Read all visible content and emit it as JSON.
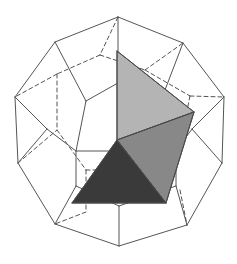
{
  "figure": {
    "type": "geometric-line-drawing",
    "canvas": {
      "width": 237,
      "height": 264,
      "background": "#ffffff"
    },
    "colors": {
      "stroke": "#555555",
      "solid_edge": "#555555",
      "hidden_edge": "#555555",
      "face_light": "#b4b4b4",
      "face_medium": "#888888",
      "face_dark": "#3a3a3a",
      "face_edge": "#4a4a4a",
      "background": "#ffffff"
    },
    "stroke_width": 1,
    "hidden_dash_pattern": "4 3"
  },
  "outer_solid": {
    "name": "dodecahedron",
    "silhouette_label": "outer-silhouette",
    "silhouette_points": "118,17 183,43 224,97 222,163 187,225 119,246 55,224 18,163 15,97 55,42",
    "visible_edges": [
      {
        "name": "edge-top-left-upper",
        "points": "118,17 55,42"
      },
      {
        "name": "edge-top-right-upper",
        "points": "118,17 183,43"
      },
      {
        "name": "edge-upper-left-to-left",
        "points": "55,42 15,97"
      },
      {
        "name": "edge-upper-right-to-right",
        "points": "183,43 224,97"
      },
      {
        "name": "edge-left-to-lower-left",
        "points": "15,97 18,163"
      },
      {
        "name": "edge-right-to-lower-right",
        "points": "224,97 222,163"
      },
      {
        "name": "edge-lower-left-to-bottom-left",
        "points": "18,163 55,224"
      },
      {
        "name": "edge-lower-right-to-bottom-right",
        "points": "222,163 187,225"
      },
      {
        "name": "edge-bottom-left-to-bottom",
        "points": "55,224 119,246"
      },
      {
        "name": "edge-bottom-to-bottom-right",
        "points": "119,246 187,225"
      },
      {
        "name": "edge-front-top-spoke",
        "points": "118,17 118,83"
      },
      {
        "name": "edge-front-upper-left-spoke",
        "points": "55,42 86,101"
      },
      {
        "name": "edge-front-upper-right-spoke",
        "points": "183,43 160,103"
      },
      {
        "name": "edge-front-left-spoke",
        "points": "15,97 47,129"
      },
      {
        "name": "edge-front-right-spoke",
        "points": "224,97 192,129"
      },
      {
        "name": "edge-front-pent-top-left",
        "points": "118,83 86,101"
      },
      {
        "name": "edge-front-pent-top-right",
        "points": "118,83 160,103"
      },
      {
        "name": "edge-front-pent-left",
        "points": "86,101 76,151"
      },
      {
        "name": "edge-front-pent-right",
        "points": "160,103 176,151"
      },
      {
        "name": "edge-front-pent-bottom",
        "points": "76,151 176,151"
      },
      {
        "name": "edge-mid-left-lower",
        "points": "47,129 76,151"
      },
      {
        "name": "edge-mid-right-lower",
        "points": "192,129 176,151"
      },
      {
        "name": "edge-lower-left-strut",
        "points": "18,163 47,129"
      },
      {
        "name": "edge-lower-right-strut",
        "points": "222,163 192,129"
      },
      {
        "name": "edge-bottom-left-to-inner",
        "points": "55,224 76,186"
      },
      {
        "name": "edge-bottom-right-to-inner",
        "points": "187,225 176,186"
      },
      {
        "name": "edge-inner-left-down",
        "points": "76,151 76,186"
      },
      {
        "name": "edge-inner-right-down",
        "points": "176,151 176,186"
      },
      {
        "name": "edge-bottom-center-left",
        "points": "76,186 119,206"
      },
      {
        "name": "edge-bottom-center-right",
        "points": "176,186 119,206"
      },
      {
        "name": "edge-bottom-center-spoke",
        "points": "119,206 119,246"
      }
    ],
    "hidden_edges": [
      {
        "name": "hidden-edge-top-back-left",
        "points": "118,17 100,55"
      },
      {
        "name": "hidden-edge-back-upper-left",
        "points": "100,55 57,74"
      },
      {
        "name": "hidden-edge-back-upper-right",
        "points": "100,55 145,70"
      },
      {
        "name": "hidden-edge-back-left-up",
        "points": "57,74 15,97"
      },
      {
        "name": "hidden-edge-back-right-up",
        "points": "145,70 183,43"
      },
      {
        "name": "hidden-edge-back-left-down",
        "points": "57,74 57,130"
      },
      {
        "name": "hidden-edge-back-right-down",
        "points": "145,70 190,96"
      },
      {
        "name": "hidden-edge-back-right-out",
        "points": "190,96 224,97"
      },
      {
        "name": "hidden-edge-back-right-lower",
        "points": "190,96 180,145"
      },
      {
        "name": "hidden-edge-back-left-lower",
        "points": "57,130 86,170"
      },
      {
        "name": "hidden-edge-back-bottom-left",
        "points": "86,170 86,212"
      },
      {
        "name": "hidden-edge-back-bottom-center",
        "points": "86,170 140,170"
      },
      {
        "name": "hidden-edge-back-bottom-right",
        "points": "140,170 180,145"
      },
      {
        "name": "hidden-edge-back-bottom-tail",
        "points": "86,212 55,224"
      },
      {
        "name": "hidden-edge-back-lower-right-tail",
        "points": "180,190 187,225"
      },
      {
        "name": "hidden-edge-back-left-mid",
        "points": "18,163 57,130"
      }
    ]
  },
  "inscribed_solid": {
    "name": "inscribed-tetrahedron",
    "faces": [
      {
        "name": "face-light-top",
        "shade": "light",
        "fill": "#b4b4b4",
        "points": "117,51 194,112 117,140"
      },
      {
        "name": "face-medium-right",
        "shade": "medium",
        "fill": "#888888",
        "points": "194,112 166,203 117,140"
      },
      {
        "name": "face-dark-bottom-left",
        "shade": "dark",
        "fill": "#3a3a3a",
        "points": "117,140 166,203 72,203"
      }
    ],
    "edges": [
      {
        "name": "tet-edge-apex-to-right",
        "points": "117,51 194,112"
      },
      {
        "name": "tet-edge-apex-to-center",
        "points": "117,51 117,140"
      },
      {
        "name": "tet-edge-right-to-center",
        "points": "194,112 117,140"
      },
      {
        "name": "tet-edge-right-to-bottom-right",
        "points": "194,112 166,203"
      },
      {
        "name": "tet-edge-center-to-bottom-right",
        "points": "117,140 166,203"
      },
      {
        "name": "tet-edge-center-to-bottom-left",
        "points": "117,140 72,203"
      },
      {
        "name": "tet-edge-bottom-left-to-bottom-right",
        "points": "72,203 166,203"
      }
    ],
    "vertices": [
      {
        "name": "vertex-apex-top",
        "x": 117,
        "y": 51
      },
      {
        "name": "vertex-right",
        "x": 194,
        "y": 112
      },
      {
        "name": "vertex-center-front",
        "x": 117,
        "y": 140
      },
      {
        "name": "vertex-bottom-left",
        "x": 72,
        "y": 203
      },
      {
        "name": "vertex-bottom-right",
        "x": 166,
        "y": 203
      }
    ]
  }
}
